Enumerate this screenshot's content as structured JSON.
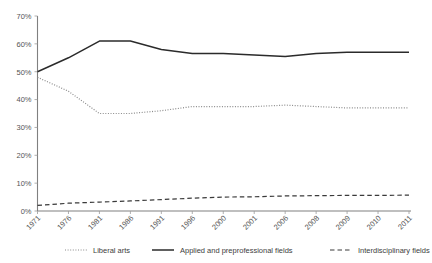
{
  "chart_data": {
    "type": "line",
    "title": "",
    "subtitle": "",
    "xlabel": "",
    "ylabel": "",
    "grid": false,
    "legend_position": "bottom",
    "ylim": [
      0,
      70
    ],
    "ytick_labels": [
      "0%",
      "10%",
      "20%",
      "30%",
      "40%",
      "50%",
      "60%",
      "70%"
    ],
    "ytick_values": [
      0,
      10,
      20,
      30,
      40,
      50,
      60,
      70
    ],
    "categories": [
      "1971",
      "1976",
      "1981",
      "1986",
      "1991",
      "1996",
      "2000",
      "2001",
      "2006",
      "2008",
      "2009",
      "2010",
      "2011"
    ],
    "series": [
      {
        "name": "Liberal arts",
        "style": "dotted",
        "color": "#8a8a8a",
        "values": [
          48,
          43,
          35,
          35,
          36,
          37.5,
          37.5,
          37.5,
          38,
          37.5,
          37,
          37,
          37
        ]
      },
      {
        "name": "Applied and preprofessional fields",
        "style": "solid",
        "color": "#2b2b2b",
        "values": [
          50,
          55,
          61,
          61,
          58,
          56.5,
          56.5,
          56,
          55.5,
          56.5,
          57,
          57,
          57
        ]
      },
      {
        "name": "Interdisciplinary fields",
        "style": "dashed",
        "color": "#3a3a3a",
        "values": [
          2,
          2.8,
          3.2,
          3.6,
          4.1,
          4.6,
          5,
          5.1,
          5.4,
          5.5,
          5.6,
          5.6,
          5.7
        ]
      }
    ],
    "legend": [
      {
        "label": "Liberal arts",
        "style": "dotted",
        "color": "#8a8a8a"
      },
      {
        "label": "Applied and preprofessional fields",
        "style": "solid",
        "color": "#2b2b2b"
      },
      {
        "label": "Interdisciplinary fields",
        "style": "dashed",
        "color": "#3a3a3a"
      }
    ]
  }
}
